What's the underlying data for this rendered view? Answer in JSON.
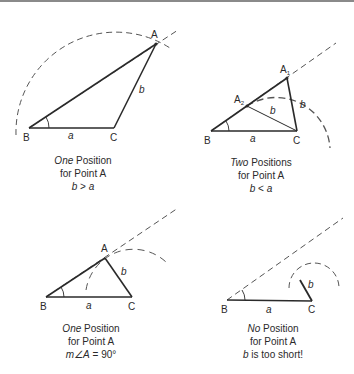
{
  "panels": [
    {
      "id": "one-position-b-greater",
      "vertices": {
        "A": "A",
        "B": "B",
        "C": "C"
      },
      "sides": {
        "a": "a",
        "b": "b"
      },
      "caption": {
        "emph": "One",
        "rest": " Position",
        "line2": "for Point A",
        "cond_var1": "b",
        "cond_op": " > ",
        "cond_var2": "a"
      }
    },
    {
      "id": "two-positions",
      "vertices": {
        "A1": "A",
        "A1_sub": "1",
        "A2": "A",
        "A2_sub": "2",
        "B": "B",
        "C": "C"
      },
      "sides": {
        "a": "a",
        "b1": "b",
        "b2": "b"
      },
      "caption": {
        "emph": "Two",
        "rest": " Positions",
        "line2": "for Point A",
        "cond_var1": "b",
        "cond_op": " < ",
        "cond_var2": "a"
      }
    },
    {
      "id": "one-position-right-angle",
      "vertices": {
        "A": "A",
        "B": "B",
        "C": "C"
      },
      "sides": {
        "a": "a",
        "b": "b"
      },
      "caption": {
        "emph": "One",
        "rest": " Position",
        "line2": "for Point A",
        "cond_var1": "m∠A",
        "cond_op": " = ",
        "cond_var2": "90°"
      }
    },
    {
      "id": "no-position",
      "vertices": {
        "B": "B",
        "C": "C"
      },
      "sides": {
        "a": "a",
        "b": "b"
      },
      "caption": {
        "emph": "No",
        "rest": " Position",
        "line2": "for Point A",
        "cond_var1": "b",
        "cond_op": " is too short!",
        "cond_var2": ""
      }
    }
  ],
  "colors": {
    "stroke": "#2a2a2a",
    "dashed": "#555555",
    "rule": "#8a8a8a",
    "background": "#ffffff"
  }
}
